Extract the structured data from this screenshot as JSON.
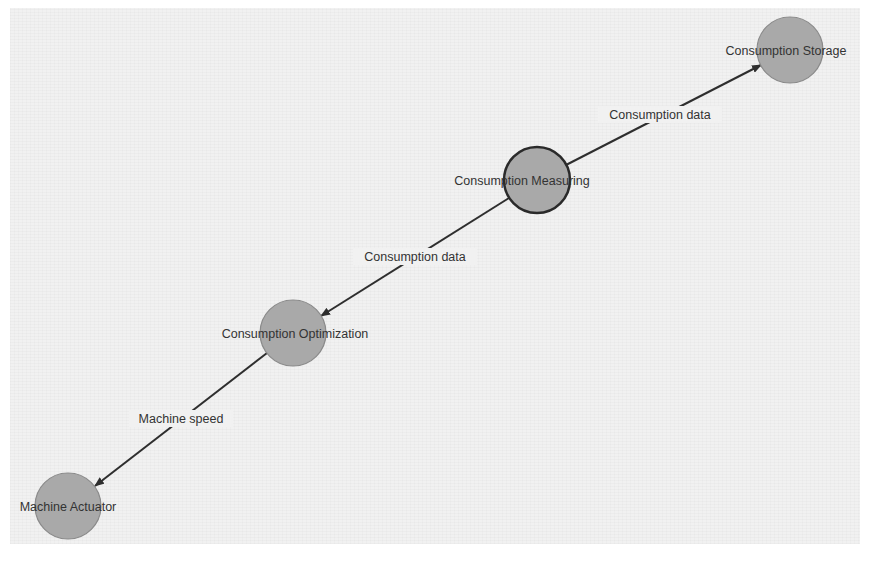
{
  "diagram": {
    "type": "directed-graph",
    "colors": {
      "background": "#f1f1f1",
      "node_fill": "#a9a9a9",
      "node_border": "#8a8a8a",
      "selected_border": "#2a2a2a",
      "edge": "#2e2e2e",
      "text": "#333333"
    },
    "nodes": [
      {
        "id": "storage",
        "label": "Consumption Storage",
        "cx": 790,
        "cy": 50,
        "r": 33,
        "selected": false
      },
      {
        "id": "measuring",
        "label": "Consumption Measuring",
        "cx": 537,
        "cy": 180,
        "r": 33,
        "selected": true
      },
      {
        "id": "optimization",
        "label": "Consumption Optimization",
        "cx": 293,
        "cy": 333,
        "r": 33,
        "selected": false
      },
      {
        "id": "actuator",
        "label": "Machine Actuator",
        "cx": 68,
        "cy": 506,
        "r": 33,
        "selected": false
      }
    ],
    "edges": [
      {
        "from": "measuring",
        "to": "storage",
        "label": "Consumption data"
      },
      {
        "from": "measuring",
        "to": "optimization",
        "label": "Consumption data"
      },
      {
        "from": "optimization",
        "to": "actuator",
        "label": "Machine speed"
      }
    ]
  }
}
